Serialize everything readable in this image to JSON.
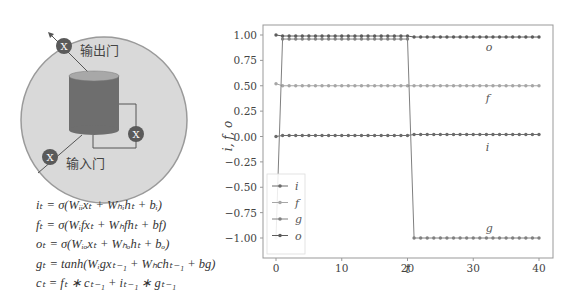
{
  "diagram": {
    "output_gate_label": "输出门",
    "input_gate_label": "输入门",
    "gate_symbol": "X",
    "colors": {
      "circle_fill": "#d9d9d9",
      "circle_stroke": "#9a9a9a",
      "cylinder_body": "#6e6e6e",
      "cylinder_top": "#a8a8a8",
      "gate_fill": "#5a5a5a"
    }
  },
  "formulas": [
    "iₜ = σ(Wᵢᵢxₜ + Wₕᵢhₜ + bᵢ)",
    "fₜ = σ(Wᵢfxₜ + Wₕfhₜ + bf)",
    "oₜ = σ(Wᵢₒxₜ + Wₕₒhₜ + bₒ)",
    "gₜ = tanh(Wᵢgxₜ₋₁ + Wₕchₜ₋₁ + bg)",
    "cₜ = fₜ ∗ cₜ₋₁ + iₜ₋₁ ∗ gₜ₋₁"
  ],
  "chart_data": {
    "type": "line",
    "title": "",
    "xlabel": "t",
    "ylabel": "i, f, o",
    "xlim": [
      -2,
      42
    ],
    "ylim": [
      -1.1,
      1.1
    ],
    "xticks": [
      0,
      10,
      20,
      30,
      40
    ],
    "xtick_labels": [
      "0",
      "10",
      "20",
      "30",
      "40"
    ],
    "yticks": [
      1.0,
      0.75,
      0.5,
      0.25,
      0.0,
      -0.25,
      -0.5,
      -0.75,
      -1.0
    ],
    "ytick_labels": [
      "1.00",
      "0.75",
      "0.50",
      "0.25",
      "0.00",
      "−0.25",
      "−0.50",
      "−0.75",
      "−1.00"
    ],
    "grid": false,
    "legend_position": "lower left",
    "x": [
      0,
      1,
      2,
      3,
      4,
      5,
      6,
      7,
      8,
      9,
      10,
      11,
      12,
      13,
      14,
      15,
      16,
      17,
      18,
      19,
      20,
      21,
      22,
      23,
      24,
      25,
      26,
      27,
      28,
      29,
      30,
      31,
      32,
      33,
      34,
      35,
      36,
      37,
      38,
      39,
      40
    ],
    "series": [
      {
        "name": "i",
        "color": "#6b6b6b",
        "values": [
          0.0,
          0.01,
          0.01,
          0.01,
          0.01,
          0.01,
          0.01,
          0.01,
          0.01,
          0.01,
          0.01,
          0.01,
          0.01,
          0.01,
          0.01,
          0.01,
          0.01,
          0.01,
          0.01,
          0.01,
          0.01,
          0.02,
          0.02,
          0.02,
          0.02,
          0.02,
          0.02,
          0.02,
          0.02,
          0.02,
          0.02,
          0.02,
          0.02,
          0.02,
          0.02,
          0.02,
          0.02,
          0.02,
          0.02,
          0.02,
          0.02
        ]
      },
      {
        "name": "f",
        "color": "#a6a6a6",
        "values": [
          0.52,
          0.5,
          0.5,
          0.5,
          0.5,
          0.5,
          0.5,
          0.5,
          0.5,
          0.5,
          0.5,
          0.5,
          0.5,
          0.5,
          0.5,
          0.5,
          0.5,
          0.5,
          0.5,
          0.5,
          0.5,
          0.5,
          0.5,
          0.5,
          0.5,
          0.5,
          0.5,
          0.5,
          0.5,
          0.5,
          0.5,
          0.5,
          0.5,
          0.5,
          0.5,
          0.5,
          0.5,
          0.5,
          0.5,
          0.5,
          0.5
        ]
      },
      {
        "name": "g",
        "color": "#808080",
        "values": [
          -1.0,
          0.96,
          0.96,
          0.96,
          0.96,
          0.96,
          0.96,
          0.96,
          0.96,
          0.96,
          0.96,
          0.96,
          0.96,
          0.96,
          0.96,
          0.96,
          0.96,
          0.96,
          0.96,
          0.96,
          0.96,
          -1.0,
          -1.0,
          -1.0,
          -1.0,
          -1.0,
          -1.0,
          -1.0,
          -1.0,
          -1.0,
          -1.0,
          -1.0,
          -1.0,
          -1.0,
          -1.0,
          -1.0,
          -1.0,
          -1.0,
          -1.0,
          -1.0,
          -1.0
        ]
      },
      {
        "name": "o",
        "color": "#5c5c5c",
        "values": [
          1.0,
          0.99,
          0.99,
          0.99,
          0.99,
          0.99,
          0.99,
          0.99,
          0.99,
          0.99,
          0.99,
          0.99,
          0.99,
          0.99,
          0.99,
          0.99,
          0.99,
          0.99,
          0.99,
          0.99,
          0.99,
          0.98,
          0.98,
          0.98,
          0.98,
          0.98,
          0.98,
          0.98,
          0.98,
          0.98,
          0.98,
          0.98,
          0.98,
          0.98,
          0.98,
          0.98,
          0.98,
          0.98,
          0.98,
          0.98,
          0.98
        ]
      }
    ],
    "annotations": [
      {
        "text": "o",
        "x": 31,
        "y": 0.88
      },
      {
        "text": "f",
        "x": 31,
        "y": 0.38
      },
      {
        "text": "i",
        "x": 31,
        "y": -0.1
      },
      {
        "text": "g",
        "x": 31,
        "y": -0.9
      }
    ]
  }
}
